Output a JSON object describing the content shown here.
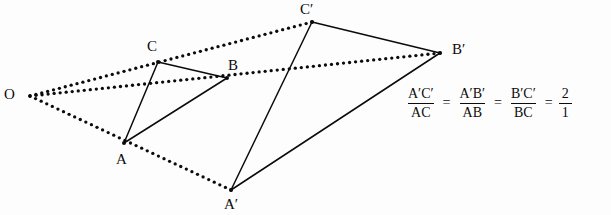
{
  "figure": {
    "background_color": "#fdfdfd",
    "stroke_color": "#0b0b0b"
  },
  "points": {
    "O": {
      "label": "O",
      "x": 30,
      "y": 96,
      "label_x": 4,
      "label_y": 87
    },
    "A": {
      "label": "A",
      "x": 124,
      "y": 143,
      "label_x": 116,
      "label_y": 152
    },
    "B": {
      "label": "B",
      "x": 227,
      "y": 78,
      "label_x": 228,
      "label_y": 58
    },
    "C": {
      "label": "C",
      "x": 158,
      "y": 62,
      "label_x": 147,
      "label_y": 39
    },
    "Ap": {
      "label": "A′",
      "x": 231,
      "y": 190,
      "label_x": 224,
      "label_y": 197
    },
    "Bp": {
      "label": "B′",
      "x": 440,
      "y": 53,
      "label_x": 452,
      "label_y": 42
    },
    "Cp": {
      "label": "C′",
      "x": 312,
      "y": 22,
      "label_x": 300,
      "label_y": 2
    }
  },
  "solid_edges": [
    {
      "name": "edge-AB",
      "from": "A",
      "to": "B"
    },
    {
      "name": "edge-BC",
      "from": "B",
      "to": "C"
    },
    {
      "name": "edge-CA",
      "from": "C",
      "to": "A"
    },
    {
      "name": "edge-ApBp",
      "from": "Ap",
      "to": "Bp"
    },
    {
      "name": "edge-BpCp",
      "from": "Bp",
      "to": "Cp"
    },
    {
      "name": "edge-CpAp",
      "from": "Cp",
      "to": "Ap"
    }
  ],
  "dotted_rays": [
    {
      "name": "ray-O-to-Cp",
      "from": "O",
      "to": "Cp"
    },
    {
      "name": "ray-O-to-Bp",
      "from": "O",
      "to": "Bp"
    },
    {
      "name": "ray-O-to-Ap",
      "from": "O",
      "to": "Ap"
    }
  ],
  "equation": {
    "terms": [
      {
        "num": "A′C′",
        "den": "AC"
      },
      {
        "num": "A′B′",
        "den": "AB"
      },
      {
        "num": "B′C′",
        "den": "BC"
      },
      {
        "num": "2",
        "den": "1"
      }
    ],
    "equals": "=",
    "full_text": "A′C′/AC = A′B′/AB = B′C′/BC = 2/1"
  }
}
